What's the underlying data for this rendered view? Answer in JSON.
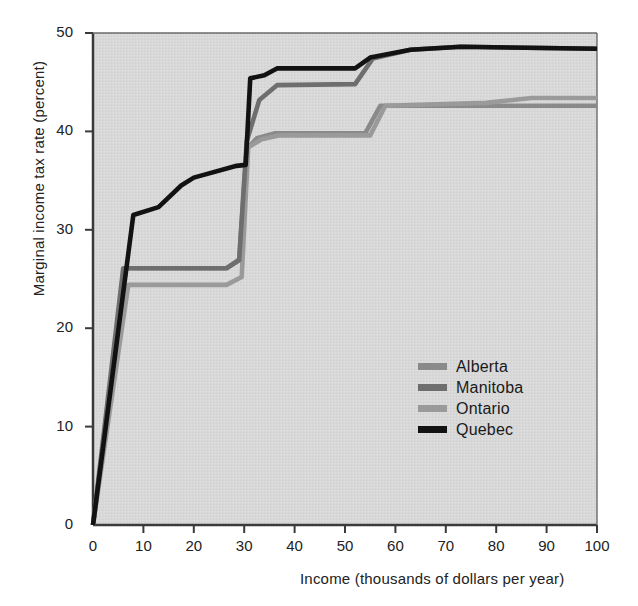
{
  "chart_data": {
    "type": "line",
    "title": "",
    "xlabel": "Income (thousands of dollars per year)",
    "ylabel": "Marginal income tax rate (percent)",
    "xlim": [
      0,
      100
    ],
    "ylim": [
      0,
      50
    ],
    "xticks": [
      0,
      10,
      20,
      30,
      40,
      50,
      60,
      70,
      80,
      90,
      100
    ],
    "yticks": [
      0,
      10,
      20,
      30,
      40,
      50
    ],
    "grid": false,
    "legend_position": "center-right",
    "plot_background": "#d8d8d8",
    "series": [
      {
        "name": "Alberta",
        "color": "#8a8a8a",
        "points": [
          [
            0,
            0
          ],
          [
            6.5,
            26.1
          ],
          [
            26.5,
            26.1
          ],
          [
            29.0,
            27.0
          ],
          [
            30.5,
            38.2
          ],
          [
            32.5,
            39.3
          ],
          [
            36.0,
            39.8
          ],
          [
            54.0,
            39.8
          ],
          [
            57.0,
            42.6
          ],
          [
            80.0,
            42.6
          ],
          [
            100,
            42.6
          ]
        ]
      },
      {
        "name": "Manitoba",
        "color": "#6e6e6e",
        "points": [
          [
            0,
            0
          ],
          [
            6.0,
            26.1
          ],
          [
            26.5,
            26.1
          ],
          [
            29.0,
            26.9
          ],
          [
            30.5,
            39.0
          ],
          [
            33.0,
            43.2
          ],
          [
            36.5,
            44.7
          ],
          [
            52.0,
            44.8
          ],
          [
            55.5,
            47.4
          ],
          [
            63.0,
            48.3
          ],
          [
            73.0,
            48.6
          ],
          [
            100,
            48.4
          ]
        ]
      },
      {
        "name": "Ontario",
        "color": "#9a9a9a",
        "points": [
          [
            0,
            0
          ],
          [
            7.0,
            24.4
          ],
          [
            26.5,
            24.4
          ],
          [
            29.5,
            25.2
          ],
          [
            30.8,
            38.4
          ],
          [
            33.5,
            39.2
          ],
          [
            37.0,
            39.6
          ],
          [
            55.0,
            39.6
          ],
          [
            58.0,
            42.6
          ],
          [
            78.0,
            42.9
          ],
          [
            87.0,
            43.4
          ],
          [
            100,
            43.4
          ]
        ]
      },
      {
        "name": "Quebec",
        "color": "#121212",
        "points": [
          [
            0,
            0
          ],
          [
            8.0,
            31.5
          ],
          [
            13.0,
            32.3
          ],
          [
            17.5,
            34.5
          ],
          [
            20.0,
            35.3
          ],
          [
            28.5,
            36.5
          ],
          [
            30.3,
            36.6
          ],
          [
            31.2,
            45.4
          ],
          [
            34.0,
            45.7
          ],
          [
            36.5,
            46.4
          ],
          [
            52.0,
            46.4
          ],
          [
            55.0,
            47.5
          ],
          [
            63.0,
            48.3
          ],
          [
            73.0,
            48.6
          ],
          [
            100,
            48.4
          ]
        ]
      }
    ]
  },
  "legend": {
    "items": [
      {
        "label": "Alberta",
        "color": "#8a8a8a"
      },
      {
        "label": "Manitoba",
        "color": "#6e6e6e"
      },
      {
        "label": "Ontario",
        "color": "#9a9a9a"
      },
      {
        "label": "Quebec",
        "color": "#121212"
      }
    ]
  }
}
